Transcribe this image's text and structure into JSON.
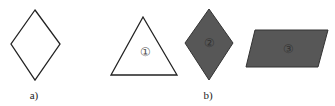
{
  "figure": {
    "panels": [
      {
        "id": "a",
        "caption": "a)",
        "shapes": [
          {
            "type": "rhombus",
            "fill": "#ffffff",
            "stroke": "#222222",
            "label": ""
          }
        ]
      },
      {
        "id": "b",
        "caption": "b)",
        "shapes": [
          {
            "type": "triangle",
            "fill": "#ffffff",
            "stroke": "#222222",
            "label": "①"
          },
          {
            "type": "rhombus",
            "fill": "#575757",
            "stroke": "#333333",
            "label": "②"
          },
          {
            "type": "parallelogram",
            "fill": "#575757",
            "stroke": "#333333",
            "label": "③"
          }
        ]
      }
    ]
  },
  "colors": {
    "dark_fill": "#575757",
    "stroke": "#222222",
    "background": "#ffffff"
  }
}
